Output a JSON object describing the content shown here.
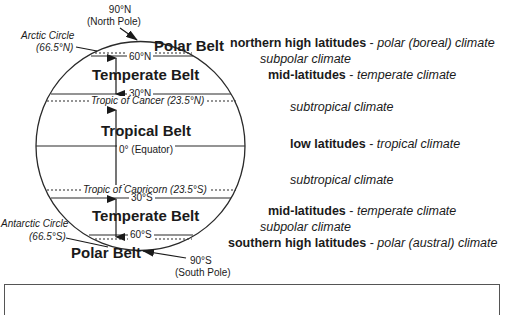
{
  "globe": {
    "north_pole": {
      "line1": "90°N",
      "line2": "(North Pole)"
    },
    "south_pole": {
      "line1": "90°S",
      "line2": "(South Pole)"
    },
    "arctic_circle": {
      "line1": "Arctic Circle",
      "line2": "(66.5°N)"
    },
    "antarctic_circle": {
      "line1": "Antarctic Circle",
      "line2": "(66.5°S)"
    },
    "lat_60n": "60°N",
    "lat_30n": "30°N",
    "equator": "0° (Equator)",
    "lat_30s": "30°S",
    "lat_60s": "60°S",
    "tropic_cancer": "Tropic of Cancer (23.5°N)",
    "tropic_capricorn": "Tropic of Capricorn (23.5°S)"
  },
  "belts": {
    "polar_north": "Polar Belt",
    "temperate_north": "Temperate Belt",
    "tropical": "Tropical Belt",
    "temperate_south": "Temperate Belt",
    "polar_south": "Polar Belt"
  },
  "climates": [
    {
      "bold": "northern high latitudes",
      "sep": " - ",
      "italic": "polar (boreal) climate"
    },
    {
      "bold": "",
      "sep": "",
      "italic": "subpolar climate"
    },
    {
      "bold": "mid-latitudes",
      "sep": " - ",
      "italic": "temperate climate"
    },
    {
      "bold": "",
      "sep": "",
      "italic": "subtropical climate"
    },
    {
      "bold": "low latitudes",
      "sep": " - ",
      "italic": "tropical climate"
    },
    {
      "bold": "",
      "sep": "",
      "italic": "subtropical climate"
    },
    {
      "bold": "mid-latitudes",
      "sep": " - ",
      "italic": "temperate climate"
    },
    {
      "bold": "",
      "sep": "",
      "italic": "subpolar climate"
    },
    {
      "bold": "southern high latitudes",
      "sep": " - ",
      "italic": "polar (austral) climate"
    }
  ],
  "colors": {
    "line": "#2a2a2a",
    "text": "#1a1a1a"
  }
}
